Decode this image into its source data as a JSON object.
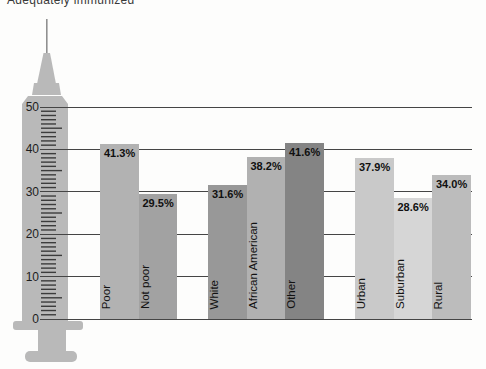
{
  "title": "Adequately immunized",
  "chart_data": {
    "type": "bar",
    "title": "Adequately immunized",
    "categories": [
      "Poor",
      "Not poor",
      "White",
      "African American",
      "Other",
      "Urban",
      "Suburban",
      "Rural"
    ],
    "values": [
      41.3,
      29.5,
      31.6,
      38.2,
      41.6,
      37.9,
      28.6,
      34.0
    ],
    "value_labels": [
      "41.3%",
      "29.5%",
      "31.6%",
      "38.2%",
      "41.6%",
      "37.9%",
      "28.6%",
      "34.0%"
    ],
    "group_sizes": [
      2,
      3,
      3
    ],
    "bar_colors": [
      "#b2b2b2",
      "#a2a2a2",
      "#989898",
      "#b1b1b1",
      "#848484",
      "#c9c9c9",
      "#d6d6d6",
      "#bcbcbc"
    ],
    "yticks": [
      0,
      10,
      20,
      30,
      40,
      50
    ],
    "ylim": [
      0,
      50
    ],
    "xlabel": "",
    "ylabel": "",
    "grid": true,
    "legend": false,
    "axis_illustration": "syringe"
  },
  "colors": {
    "syringe_body": "#b9b9b9",
    "syringe_tick": "#3c3c3c",
    "grid_line": "#454545",
    "text": "#121212"
  }
}
